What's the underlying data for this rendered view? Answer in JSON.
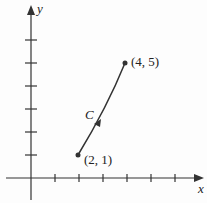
{
  "diagram": {
    "type": "curve-on-axes",
    "axes": {
      "x_label": "x",
      "y_label": "y",
      "x_ticks": 6,
      "y_ticks": 6
    },
    "curve": {
      "label": "C",
      "direction": "from (2, 1) to (4, 5)"
    },
    "points": [
      {
        "label": "(2, 1)",
        "x": 2,
        "y": 1
      },
      {
        "label": "(4, 5)",
        "x": 4,
        "y": 5
      }
    ],
    "colors": {
      "stroke": "#333333"
    }
  }
}
